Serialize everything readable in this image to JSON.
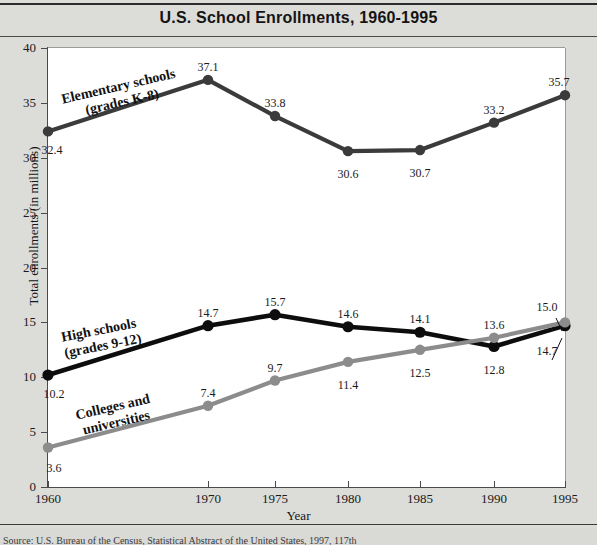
{
  "figure": {
    "title": "U.S. School Enrollments, 1960-1995",
    "source_note": "Source: U.S. Bureau of the Census, Statistical Abstract of the United States, 1997, 117th"
  },
  "chart_data": {
    "type": "line",
    "title": "U.S. School Enrollments, 1960-1995",
    "xlabel": "Year",
    "ylabel": "Total enrollments (in millions)",
    "categories": [
      "1960",
      "1970",
      "1975",
      "1980",
      "1985",
      "1990",
      "1995"
    ],
    "x": [
      1960,
      1970,
      1975,
      1980,
      1985,
      1990,
      1995
    ],
    "ylim": [
      0,
      40
    ],
    "yticks": [
      "0",
      "5",
      "10",
      "15",
      "20",
      "25",
      "30",
      "35",
      "40"
    ],
    "grid": false,
    "legend": "inline-annotations",
    "series": [
      {
        "name": "Elementary schools (grades K-8)",
        "label_line1": "Elementary schools",
        "label_line2": "(grades K-8)",
        "color": "#3b3b3b",
        "values": [
          32.4,
          37.1,
          33.8,
          30.6,
          30.7,
          33.2,
          35.7
        ],
        "value_labels": [
          "32.4",
          "37.1",
          "33.8",
          "30.6",
          "30.7",
          "33.2",
          "35.7"
        ]
      },
      {
        "name": "High schools (grades 9-12)",
        "label_line1": "High schools",
        "label_line2": "(grades 9-12)",
        "color": "#0d0d0d",
        "values": [
          10.2,
          14.7,
          15.7,
          14.6,
          14.1,
          12.8,
          14.7
        ],
        "value_labels": [
          "10.2",
          "14.7",
          "15.7",
          "14.6",
          "14.1",
          "12.8",
          "14.7"
        ]
      },
      {
        "name": "Colleges and universities",
        "label_line1": "Colleges and",
        "label_line2": "universities",
        "color": "#8c8c8c",
        "values": [
          3.6,
          7.4,
          9.7,
          11.4,
          12.5,
          13.6,
          15.0
        ],
        "value_labels": [
          "3.6",
          "7.4",
          "9.7",
          "11.4",
          "12.5",
          "13.6",
          "15.0"
        ]
      }
    ]
  }
}
